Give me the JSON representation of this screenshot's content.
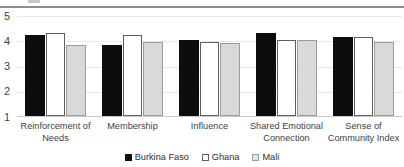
{
  "chart_data": {
    "type": "bar",
    "title": "",
    "subtitle": "",
    "xlabel": "",
    "ylabel": "",
    "ylim": [
      1,
      5
    ],
    "yticks": [
      "5",
      "4",
      "3",
      "2",
      "1"
    ],
    "grid": true,
    "legend_position": "bottom",
    "categories": [
      "Reinforcement of Needs",
      "Membership",
      "Influence",
      "Shared Emotional Connection",
      "Sense of Community Index"
    ],
    "category_lines": [
      [
        "Reinforcement of",
        "Needs"
      ],
      [
        "Membership"
      ],
      [
        "Influence"
      ],
      [
        "Shared Emotional",
        "Connection"
      ],
      [
        "Sense of",
        "Community Index"
      ]
    ],
    "series": [
      {
        "name": "Burkina Faso",
        "color": "#0d0d0d",
        "values": [
          4.2,
          3.8,
          4.0,
          4.3,
          4.12
        ]
      },
      {
        "name": "Ghana",
        "color": "#ffffff",
        "values": [
          4.28,
          4.2,
          3.95,
          4.0,
          4.13
        ]
      },
      {
        "name": "Mali",
        "color": "#d9d9d9",
        "values": [
          3.8,
          3.93,
          3.88,
          4.0,
          3.95
        ]
      }
    ]
  },
  "legend": {
    "items": [
      {
        "label": "Burkina Faso"
      },
      {
        "label": "Ghana"
      },
      {
        "label": "Mali"
      }
    ]
  }
}
